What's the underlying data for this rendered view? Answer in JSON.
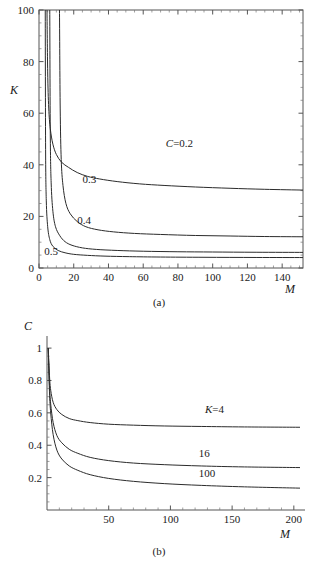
{
  "figure": {
    "caption_a": "(a)",
    "caption_b": "(b)"
  },
  "chart_data": [
    {
      "id": "panel-a",
      "type": "line",
      "title": "",
      "xlabel": "M",
      "ylabel": "K",
      "xlim": [
        0,
        152
      ],
      "ylim": [
        0,
        100
      ],
      "xticks": [
        0,
        20,
        40,
        60,
        80,
        100,
        120,
        140
      ],
      "yticks": [
        0,
        20,
        40,
        60,
        80,
        100
      ],
      "xtick_labels": [
        "0",
        "20",
        "40",
        "60",
        "80",
        "100",
        "120",
        "140"
      ],
      "ytick_labels": [
        "0",
        "20",
        "40",
        "60",
        "80",
        "100"
      ],
      "grid": false,
      "frame": "box",
      "legend": "inline-labels",
      "annotations": [
        {
          "text": "C=0.2",
          "italic_prefix": "C",
          "rest": "=0.2",
          "x": 73,
          "y": 47
        },
        {
          "text": "0.3",
          "x": 25,
          "y": 33
        },
        {
          "text": "0.4",
          "x": 22,
          "y": 17
        },
        {
          "text": "0.5",
          "x": 3,
          "y": 5
        }
      ],
      "series": [
        {
          "name": "C=0.2",
          "label": "C=0.2",
          "C": 0.2,
          "asymptote_K": 30,
          "asymptote_M": 4.0,
          "points": [
            [
              4.6,
              100
            ],
            [
              5.0,
              76
            ],
            [
              5.6,
              62
            ],
            [
              6.5,
              54
            ],
            [
              8,
              48
            ],
            [
              10,
              44
            ],
            [
              13,
              41
            ],
            [
              17,
              39
            ],
            [
              22,
              37
            ],
            [
              28,
              35.5
            ],
            [
              35,
              34.5
            ],
            [
              45,
              33.5
            ],
            [
              58,
              32.6
            ],
            [
              72,
              32.0
            ],
            [
              90,
              31.4
            ],
            [
              110,
              30.9
            ],
            [
              130,
              30.5
            ],
            [
              152,
              30.2
            ]
          ]
        },
        {
          "name": "0.3",
          "label": "0.3",
          "C": 0.3,
          "asymptote_K": 12,
          "asymptote_M": 11.5,
          "points": [
            [
              11.8,
              100
            ],
            [
              12.2,
              62
            ],
            [
              12.8,
              42
            ],
            [
              13.8,
              32
            ],
            [
              15.5,
              25
            ],
            [
              18,
              21
            ],
            [
              22,
              18
            ],
            [
              27,
              16
            ],
            [
              34,
              14.8
            ],
            [
              43,
              14.0
            ],
            [
              55,
              13.4
            ],
            [
              70,
              13.0
            ],
            [
              90,
              12.6
            ],
            [
              110,
              12.4
            ],
            [
              130,
              12.2
            ],
            [
              152,
              12.1
            ]
          ]
        },
        {
          "name": "0.4",
          "label": "0.4",
          "C": 0.4,
          "asymptote_K": 6,
          "asymptote_M": 6.0,
          "points": [
            [
              6.2,
              100
            ],
            [
              6.5,
              52
            ],
            [
              7.0,
              33
            ],
            [
              8.0,
              22
            ],
            [
              9.5,
              16
            ],
            [
              12,
              12.5
            ],
            [
              15,
              10.2
            ],
            [
              19,
              8.8
            ],
            [
              25,
              7.8
            ],
            [
              33,
              7.2
            ],
            [
              45,
              6.8
            ],
            [
              60,
              6.5
            ],
            [
              80,
              6.3
            ],
            [
              100,
              6.2
            ],
            [
              125,
              6.1
            ],
            [
              152,
              6.05
            ]
          ]
        },
        {
          "name": "0.5",
          "label": "0.5",
          "C": 0.5,
          "asymptote_K": 4,
          "asymptote_M": 3.2,
          "points": [
            [
              3.6,
              100
            ],
            [
              3.8,
              46
            ],
            [
              4.2,
              26
            ],
            [
              5.0,
              16
            ],
            [
              6.2,
              11
            ],
            [
              8,
              8.4
            ],
            [
              11,
              6.8
            ],
            [
              15,
              5.9
            ],
            [
              20,
              5.3
            ],
            [
              28,
              4.9
            ],
            [
              38,
              4.6
            ],
            [
              52,
              4.4
            ],
            [
              70,
              4.25
            ],
            [
              95,
              4.15
            ],
            [
              125,
              4.08
            ],
            [
              152,
              4.05
            ]
          ]
        }
      ]
    },
    {
      "id": "panel-b",
      "type": "line",
      "title": "",
      "xlabel": "M",
      "ylabel": "C",
      "xlim": [
        0,
        205
      ],
      "ylim": [
        0,
        1.05
      ],
      "xticks": [
        50,
        100,
        150,
        200
      ],
      "yticks": [
        0.2,
        0.4,
        0.6,
        0.8,
        1
      ],
      "xtick_labels": [
        "50",
        "100",
        "150",
        "200"
      ],
      "ytick_labels": [
        "0.2",
        "0.4",
        "0.6",
        "0.8",
        "1"
      ],
      "grid": false,
      "frame": "axes",
      "legend": "inline-labels",
      "annotations": [
        {
          "text": "K=4",
          "italic_prefix": "K",
          "rest": "=4",
          "x": 128,
          "y": 0.6
        },
        {
          "text": "16",
          "x": 123,
          "y": 0.33
        },
        {
          "text": "100",
          "x": 123,
          "y": 0.205
        }
      ],
      "series": [
        {
          "name": "K=4",
          "label": "K=4",
          "K": 4,
          "asymptote_C": 0.51,
          "points": [
            [
              1,
              1.0
            ],
            [
              2,
              0.83
            ],
            [
              3,
              0.74
            ],
            [
              5,
              0.665
            ],
            [
              8,
              0.62
            ],
            [
              12,
              0.59
            ],
            [
              18,
              0.565
            ],
            [
              25,
              0.552
            ],
            [
              35,
              0.54
            ],
            [
              50,
              0.53
            ],
            [
              70,
              0.524
            ],
            [
              95,
              0.519
            ],
            [
              125,
              0.516
            ],
            [
              160,
              0.513
            ],
            [
              205,
              0.511
            ]
          ]
        },
        {
          "name": "16",
          "label": "16",
          "K": 16,
          "asymptote_C": 0.26,
          "points": [
            [
              1,
              1.0
            ],
            [
              2,
              0.77
            ],
            [
              3,
              0.655
            ],
            [
              5,
              0.54
            ],
            [
              8,
              0.46
            ],
            [
              12,
              0.415
            ],
            [
              18,
              0.375
            ],
            [
              25,
              0.35
            ],
            [
              35,
              0.325
            ],
            [
              50,
              0.305
            ],
            [
              70,
              0.29
            ],
            [
              95,
              0.28
            ],
            [
              125,
              0.272
            ],
            [
              160,
              0.266
            ],
            [
              205,
              0.262
            ]
          ]
        },
        {
          "name": "100",
          "label": "100",
          "K": 100,
          "asymptote_C": 0.13,
          "points": [
            [
              1,
              1.0
            ],
            [
              2,
              0.73
            ],
            [
              3,
              0.6
            ],
            [
              5,
              0.465
            ],
            [
              8,
              0.37
            ],
            [
              12,
              0.315
            ],
            [
              18,
              0.272
            ],
            [
              25,
              0.245
            ],
            [
              35,
              0.218
            ],
            [
              50,
              0.195
            ],
            [
              70,
              0.177
            ],
            [
              95,
              0.163
            ],
            [
              125,
              0.152
            ],
            [
              160,
              0.143
            ],
            [
              205,
              0.135
            ]
          ]
        }
      ]
    }
  ]
}
